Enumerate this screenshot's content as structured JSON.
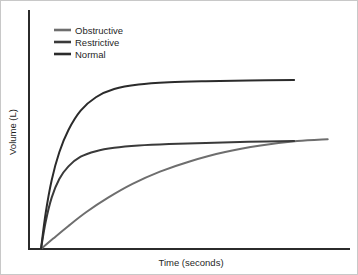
{
  "figure": {
    "background_color": "#ffffff",
    "border_color": "#c8c8c8",
    "width": 358,
    "height": 275
  },
  "axes": {
    "x_label": "Time (seconds)",
    "y_label": "Volume (L)",
    "axis_color": "#2b2b2b",
    "has_ticks": false,
    "has_tick_labels": false,
    "has_grid": false
  },
  "legend": {
    "position": "upper-left-inside",
    "items": [
      {
        "label": "Obstructive",
        "color": "#6e6e6e"
      },
      {
        "label": "Restrictive",
        "color": "#3a3a3a"
      },
      {
        "label": "Normal",
        "color": "#2b2b2b"
      }
    ]
  },
  "chart_data": {
    "type": "line",
    "title": "",
    "subtitle": "",
    "xlabel": "Time (seconds)",
    "ylabel": "Volume (L)",
    "xlim": [
      0,
      10
    ],
    "ylim": [
      0,
      5
    ],
    "grid": false,
    "legend_position": "upper left",
    "x_tick_labels": [],
    "y_tick_labels": [],
    "annotations": [],
    "series": [
      {
        "name": "Normal",
        "color": "#2b2b2b",
        "description": "Rapid rise to a high plateau; largest total volume reached quickly",
        "x": [
          0.0,
          0.15,
          0.35,
          0.6,
          0.9,
          1.3,
          1.8,
          2.4,
          3.2,
          4.2,
          5.4,
          6.8,
          8.3
        ],
        "y": [
          0.0,
          0.95,
          1.85,
          2.6,
          3.2,
          3.72,
          4.08,
          4.3,
          4.42,
          4.48,
          4.51,
          4.53,
          4.54
        ]
      },
      {
        "name": "Restrictive",
        "color": "#3a3a3a",
        "description": "Rapid rise to a low plateau; reduced total volume reached quickly",
        "x": [
          0.0,
          0.15,
          0.35,
          0.6,
          0.9,
          1.3,
          1.8,
          2.4,
          3.2,
          4.2,
          5.4,
          6.8,
          8.3
        ],
        "y": [
          0.0,
          0.72,
          1.38,
          1.88,
          2.22,
          2.48,
          2.63,
          2.72,
          2.78,
          2.82,
          2.85,
          2.88,
          2.9
        ]
      },
      {
        "name": "Obstructive",
        "color": "#6e6e6e",
        "description": "Slow gradual rise still climbing at end of test; delayed emptying",
        "x": [
          0.0,
          0.4,
          0.9,
          1.5,
          2.2,
          3.0,
          3.9,
          4.9,
          6.0,
          7.2,
          8.4,
          9.4
        ],
        "y": [
          0.0,
          0.28,
          0.62,
          1.0,
          1.38,
          1.75,
          2.08,
          2.36,
          2.6,
          2.78,
          2.9,
          2.95
        ]
      }
    ]
  }
}
